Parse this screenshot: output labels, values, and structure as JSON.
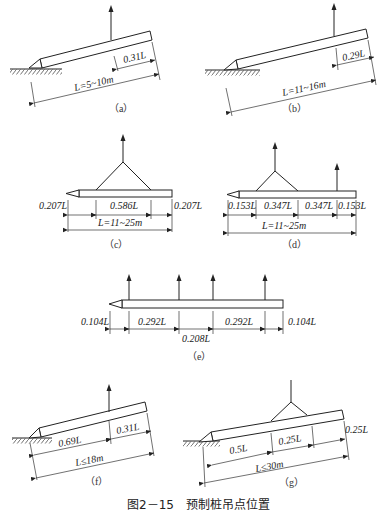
{
  "figure": {
    "title": "图2－15　预制桩吊点位置"
  },
  "panels": {
    "a": {
      "caption": "（a）",
      "length_label": "L=5~10m",
      "segments": [
        "0.31L"
      ],
      "lift_points": 1,
      "description": "Inclined pile resting on ground, single lifting point"
    },
    "b": {
      "caption": "（b）",
      "length_label": "L=11~16m",
      "segments": [
        "0.29L"
      ],
      "lift_points": 1,
      "description": "Inclined pile resting on ground, single lifting point"
    },
    "c": {
      "caption": "（c）",
      "length_label": "L=11~25m",
      "segments": [
        "0.207L",
        "0.586L",
        "0.207L"
      ],
      "lift_points": 2,
      "description": "Horizontal pile, two lifting points joined by sling"
    },
    "d": {
      "caption": "（d）",
      "length_label": "L=11~25m",
      "segments": [
        "0.153L",
        "0.347L",
        "0.347L",
        "0.153L"
      ],
      "lift_points": 3,
      "description": "Horizontal pile, three lifting points (two slung + one single)"
    },
    "e": {
      "caption": "（e）",
      "segments": [
        "0.104L",
        "0.292L",
        "0.208L",
        "0.292L",
        "0.104L"
      ],
      "lift_points": 4,
      "description": "Horizontal pile, four lifting points"
    },
    "f": {
      "caption": "（f）",
      "length_label": "L≤18m",
      "segments": [
        "0.69L",
        "0.31L"
      ],
      "lift_points": 1,
      "description": "Inclined pile, single lifting point"
    },
    "g": {
      "caption": "（g）",
      "length_label": "L≤30m",
      "segments": [
        "0.5L",
        "0.25L",
        "0.25L"
      ],
      "lift_points": 2,
      "description": "Inclined pile, two lifting points joined by sling"
    }
  }
}
